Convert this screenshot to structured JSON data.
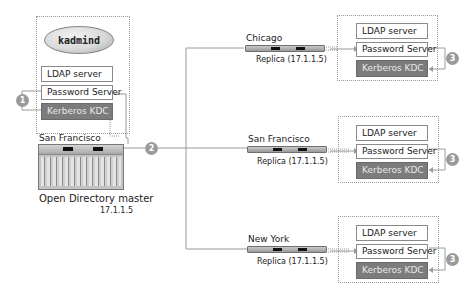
{
  "diagram": {
    "master": {
      "group_label": "kadmind",
      "services": [
        "LDAP  server",
        "Password Server",
        "Kerberos KDC"
      ],
      "location": "San Francisco",
      "title": "Open Directory master",
      "ip": "17.1.1.5",
      "step_badge": "1"
    },
    "link_badge": "2",
    "replicas": [
      {
        "location": "Chicago",
        "label": "Replica (17.1.1.5)",
        "services": [
          "LDAP  server",
          "Password Server",
          "Kerberos KDC"
        ],
        "step_badge": "3"
      },
      {
        "location": "San Francisco",
        "label": "Replica (17.1.1.5)",
        "services": [
          "LDAP  server",
          "Password Server",
          "Kerberos KDC"
        ],
        "step_badge": "3"
      },
      {
        "location": "New York",
        "label": "Replica (17.1.1.5)",
        "services": [
          "LDAP  server",
          "Password Server",
          "Kerberos KDC"
        ],
        "step_badge": "3"
      }
    ],
    "colors": {
      "line": "#9a9a9a",
      "kdc_fill": "#7c7c7c",
      "badge": "#9a9a9a"
    }
  }
}
